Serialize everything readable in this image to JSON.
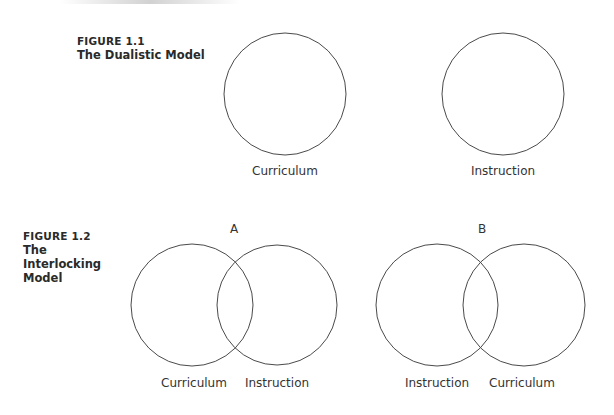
{
  "figure_1_1": {
    "number": "FIGURE 1.1",
    "title": "The Dualistic Model",
    "circles": [
      {
        "label": "Curriculum"
      },
      {
        "label": "Instruction"
      }
    ]
  },
  "figure_1_2": {
    "number": "FIGURE 1.2",
    "title": "The Interlocking Model",
    "panels": [
      {
        "tag": "A",
        "left_label": "Curriculum",
        "right_label": "Instruction"
      },
      {
        "tag": "B",
        "left_label": "Instruction",
        "right_label": "Curriculum"
      }
    ]
  },
  "colors": {
    "stroke": "#4a4a4a",
    "text": "#2a2a2a",
    "background": "#ffffff"
  }
}
